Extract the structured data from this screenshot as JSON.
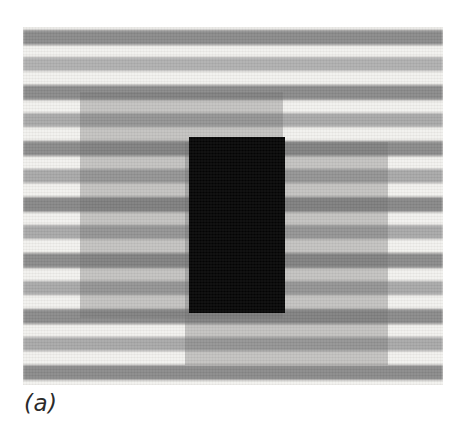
{
  "figure": {
    "caption_label": "(a)",
    "background_color": "#ffffff"
  },
  "plate": {
    "x": 23,
    "y": 27,
    "width": 420,
    "height": 358,
    "base_color": "#f2f1ee"
  },
  "palette": {
    "light_band": "#f2f1ee",
    "dark_band": "#8a8a8a",
    "mid_band": "#b0b0b0",
    "overlay_gray": "#6e6e6e",
    "overlay_opacity": "0.36",
    "black_patch": "#050505",
    "caption_color": "#2b2b2b"
  },
  "grating": {
    "orientation": "horizontal",
    "period_px": 28,
    "band_height_px": 14,
    "stripes": [
      {
        "top": 3,
        "height": 15,
        "color": "#8a8a8a",
        "tone": "dark"
      },
      {
        "top": 30,
        "height": 14,
        "color": "#b0b0b0",
        "tone": "mid"
      },
      {
        "top": 58,
        "height": 15,
        "color": "#8a8a8a",
        "tone": "dark"
      },
      {
        "top": 86,
        "height": 14,
        "color": "#a8a8a8",
        "tone": "mid"
      },
      {
        "top": 114,
        "height": 15,
        "color": "#8a8a8a",
        "tone": "dark"
      },
      {
        "top": 142,
        "height": 14,
        "color": "#a8a8a8",
        "tone": "mid"
      },
      {
        "top": 170,
        "height": 15,
        "color": "#878787",
        "tone": "dark"
      },
      {
        "top": 198,
        "height": 14,
        "color": "#a8a8a8",
        "tone": "mid"
      },
      {
        "top": 226,
        "height": 15,
        "color": "#8a8a8a",
        "tone": "dark"
      },
      {
        "top": 254,
        "height": 14,
        "color": "#a8a8a8",
        "tone": "mid"
      },
      {
        "top": 282,
        "height": 15,
        "color": "#8a8a8a",
        "tone": "dark"
      },
      {
        "top": 310,
        "height": 14,
        "color": "#a8a8a8",
        "tone": "mid"
      },
      {
        "top": 338,
        "height": 15,
        "color": "#8a8a8a",
        "tone": "dark"
      }
    ]
  },
  "overlays": [
    {
      "name": "upper-left-translucent-rectangle",
      "x": 57,
      "y": 65,
      "width": 203,
      "height": 226,
      "color": "#6e6e6e",
      "opacity": 0.36
    },
    {
      "name": "lower-right-translucent-rectangle",
      "x": 162,
      "y": 115,
      "width": 203,
      "height": 223,
      "color": "#6e6e6e",
      "opacity": 0.36
    }
  ],
  "black_rectangle": {
    "name": "opaque-black-rectangle",
    "x": 166,
    "y": 110,
    "width": 96,
    "height": 176,
    "color": "#050505"
  }
}
